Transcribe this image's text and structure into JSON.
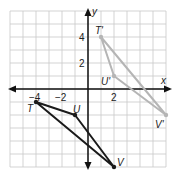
{
  "axes": {
    "x_label": "x",
    "y_label": "y",
    "x_ticks": [
      {
        "value": -4,
        "label": "−4"
      },
      {
        "value": -2,
        "label": "−2"
      },
      {
        "value": 2,
        "label": "2"
      }
    ],
    "y_ticks": [
      {
        "value": 4,
        "label": "4"
      },
      {
        "value": 2,
        "label": "2"
      }
    ],
    "range": {
      "xmin": -6,
      "xmax": 6,
      "ymin": -6,
      "ymax": 6
    }
  },
  "original_triangle": {
    "color": "#1a1a1a",
    "vertices": [
      {
        "name": "T",
        "label": "T",
        "x": -4,
        "y": -1
      },
      {
        "name": "U",
        "label": "U",
        "x": -1,
        "y": -2
      },
      {
        "name": "V",
        "label": "V",
        "x": 2,
        "y": -6
      }
    ]
  },
  "image_triangle": {
    "color": "#b5b5b5",
    "vertices": [
      {
        "name": "T'",
        "label": "T'",
        "x": 1,
        "y": 4
      },
      {
        "name": "U'",
        "label": "U'",
        "x": 2,
        "y": 1
      },
      {
        "name": "V'",
        "label": "V'",
        "x": 6,
        "y": -2
      }
    ]
  },
  "colors": {
    "grid": "#c8c8c8",
    "axis": "#111111"
  }
}
